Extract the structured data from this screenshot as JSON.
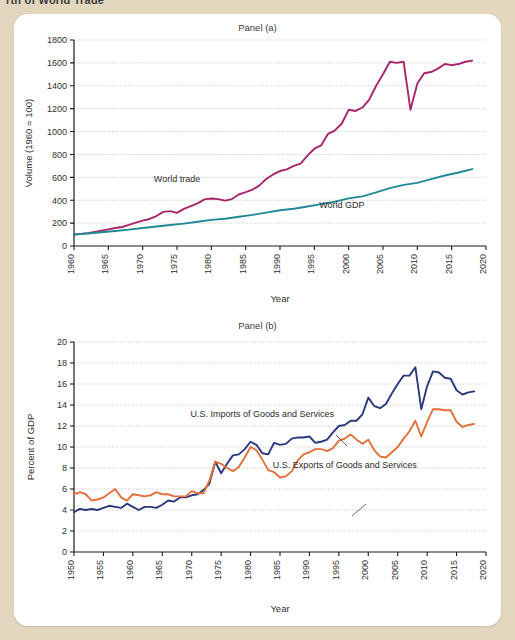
{
  "page": {
    "cut_off_title": "rth of World Trade",
    "background_color": "#e2d7be",
    "card_color": "#ffffff"
  },
  "panel_a": {
    "title": "Panel (a)",
    "xlabel": "Year",
    "ylabel": "Volume (1960 = 100)"
  },
  "panel_b": {
    "title": "Panel (b)",
    "xlabel": "Year",
    "ylabel": "Percent of GDP"
  },
  "chart_data": [
    {
      "type": "line",
      "title": "Panel (a)",
      "xlabel": "Year",
      "ylabel": "Volume (1960 = 100)",
      "xlim": [
        1960,
        2020
      ],
      "ylim": [
        0,
        1800
      ],
      "xticks": [
        1960,
        1965,
        1970,
        1975,
        1980,
        1985,
        1990,
        1995,
        2000,
        2005,
        2010,
        2015,
        2020
      ],
      "yticks": [
        0,
        200,
        400,
        600,
        800,
        1000,
        1200,
        1400,
        1600,
        1800
      ],
      "grid": "horizontal-dotted",
      "legend": "inline-annotations",
      "series": [
        {
          "name": "World trade",
          "color": "#a8246b",
          "label_x": 1975,
          "label_y": 560,
          "x": [
            1960,
            1961,
            1962,
            1963,
            1964,
            1965,
            1966,
            1967,
            1968,
            1969,
            1970,
            1971,
            1972,
            1973,
            1974,
            1975,
            1976,
            1977,
            1978,
            1979,
            1980,
            1981,
            1982,
            1983,
            1984,
            1985,
            1986,
            1987,
            1988,
            1989,
            1990,
            1991,
            1992,
            1993,
            1994,
            1995,
            1996,
            1997,
            1998,
            1999,
            2000,
            2001,
            2002,
            2003,
            2004,
            2005,
            2006,
            2007,
            2008,
            2009,
            2010,
            2011,
            2012,
            2013,
            2014,
            2015,
            2016,
            2017,
            2018
          ],
          "values": [
            100,
            106,
            113,
            122,
            134,
            145,
            157,
            166,
            184,
            204,
            222,
            236,
            262,
            298,
            305,
            290,
            325,
            348,
            372,
            407,
            415,
            410,
            396,
            410,
            450,
            470,
            492,
            530,
            585,
            625,
            655,
            670,
            700,
            720,
            790,
            850,
            880,
            980,
            1010,
            1070,
            1190,
            1180,
            1210,
            1280,
            1400,
            1500,
            1610,
            1600,
            1610,
            1190,
            1420,
            1510,
            1520,
            1550,
            1590,
            1580,
            1590,
            1610,
            1620
          ]
        },
        {
          "name": "World GDP",
          "color": "#1f8a96",
          "label_x": 1999,
          "label_y": 330,
          "x": [
            1960,
            1962,
            1964,
            1966,
            1968,
            1970,
            1972,
            1974,
            1976,
            1978,
            1980,
            1982,
            1984,
            1986,
            1988,
            1990,
            1992,
            1994,
            1996,
            1998,
            2000,
            2002,
            2004,
            2006,
            2008,
            2010,
            2012,
            2014,
            2016,
            2018
          ],
          "values": [
            100,
            109,
            120,
            131,
            143,
            157,
            170,
            183,
            196,
            212,
            228,
            238,
            256,
            272,
            292,
            312,
            325,
            345,
            366,
            388,
            416,
            434,
            468,
            506,
            534,
            552,
            584,
            616,
            642,
            672
          ]
        }
      ]
    },
    {
      "type": "line",
      "title": "Panel (b)",
      "xlabel": "Year",
      "ylabel": "Percent of GDP",
      "xlim": [
        1950,
        2020
      ],
      "ylim": [
        0,
        20
      ],
      "xticks": [
        1950,
        1955,
        1960,
        1965,
        1970,
        1975,
        1980,
        1985,
        1990,
        1995,
        2000,
        2005,
        2010,
        2015,
        2020
      ],
      "yticks": [
        0,
        2,
        4,
        6,
        8,
        10,
        12,
        14,
        16,
        18,
        20
      ],
      "grid": "horizontal-dotted",
      "legend": "inline-annotations",
      "series": [
        {
          "name": "U.S. Imports of Goods and Services",
          "color": "#2a3a7c",
          "label_x": 1982,
          "label_y": 12.9,
          "x": [
            1950,
            1951,
            1952,
            1953,
            1954,
            1955,
            1956,
            1957,
            1958,
            1959,
            1960,
            1961,
            1962,
            1963,
            1964,
            1965,
            1966,
            1967,
            1968,
            1969,
            1970,
            1971,
            1972,
            1973,
            1974,
            1975,
            1976,
            1977,
            1978,
            1979,
            1980,
            1981,
            1982,
            1983,
            1984,
            1985,
            1986,
            1987,
            1988,
            1989,
            1990,
            1991,
            1992,
            1993,
            1994,
            1995,
            1996,
            1997,
            1998,
            1999,
            2000,
            2001,
            2002,
            2003,
            2004,
            2005,
            2006,
            2007,
            2008,
            2009,
            2010,
            2011,
            2012,
            2013,
            2014,
            2015,
            2016,
            2017,
            2018
          ],
          "values": [
            3.8,
            4.1,
            4.0,
            4.1,
            4.0,
            4.2,
            4.4,
            4.3,
            4.2,
            4.6,
            4.3,
            4.0,
            4.3,
            4.3,
            4.2,
            4.5,
            4.9,
            4.8,
            5.2,
            5.2,
            5.4,
            5.5,
            5.9,
            6.5,
            8.6,
            7.5,
            8.4,
            9.2,
            9.3,
            9.8,
            10.5,
            10.2,
            9.4,
            9.3,
            10.4,
            10.2,
            10.3,
            10.8,
            10.9,
            10.9,
            11.0,
            10.4,
            10.5,
            10.7,
            11.4,
            12.0,
            12.1,
            12.5,
            12.5,
            13.1,
            14.7,
            13.9,
            13.7,
            14.1,
            15.1,
            16.0,
            16.8,
            16.8,
            17.6,
            13.6,
            15.8,
            17.2,
            17.1,
            16.6,
            16.5,
            15.4,
            15.0,
            15.2,
            15.3
          ]
        },
        {
          "name": "U.S. Exports of Goods and Services",
          "color": "#e2703a",
          "label_x": 1996,
          "label_y": 8.0,
          "x": [
            1950,
            1951,
            1952,
            1953,
            1954,
            1955,
            1956,
            1957,
            1958,
            1959,
            1960,
            1961,
            1962,
            1963,
            1964,
            1965,
            1966,
            1967,
            1968,
            1969,
            1970,
            1971,
            1972,
            1973,
            1974,
            1975,
            1976,
            1977,
            1978,
            1979,
            1980,
            1981,
            1982,
            1983,
            1984,
            1985,
            1986,
            1987,
            1988,
            1989,
            1990,
            1991,
            1992,
            1993,
            1994,
            1995,
            1996,
            1997,
            1998,
            1999,
            2000,
            2001,
            2002,
            2003,
            2004,
            2005,
            2006,
            2007,
            2008,
            2009,
            2010,
            2011,
            2012,
            2013,
            2014,
            2015,
            2016,
            2017,
            2018
          ],
          "values": [
            5.5,
            5.7,
            5.5,
            4.9,
            5.0,
            5.2,
            5.6,
            6.0,
            5.2,
            4.9,
            5.5,
            5.4,
            5.3,
            5.4,
            5.7,
            5.5,
            5.5,
            5.3,
            5.3,
            5.3,
            5.8,
            5.6,
            5.6,
            6.8,
            8.6,
            8.4,
            8.0,
            7.7,
            8.1,
            9.0,
            10.0,
            9.7,
            8.8,
            7.8,
            7.6,
            7.1,
            7.2,
            7.7,
            8.7,
            9.3,
            9.5,
            9.8,
            9.8,
            9.6,
            9.9,
            10.6,
            10.8,
            11.2,
            10.7,
            10.3,
            10.7,
            9.7,
            9.1,
            9.0,
            9.5,
            10.0,
            10.8,
            11.5,
            12.5,
            11.0,
            12.4,
            13.6,
            13.6,
            13.5,
            13.5,
            12.4,
            11.9,
            12.1,
            12.2
          ]
        }
      ]
    }
  ]
}
